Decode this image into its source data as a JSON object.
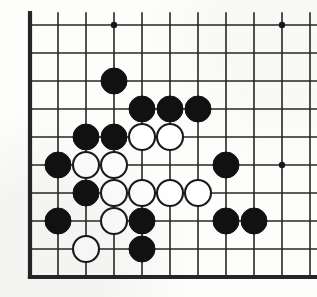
{
  "app": {
    "title": "Go Board Diagram",
    "game": "Go (Weiqi/Baduk)"
  },
  "board": {
    "width_px": 317,
    "height_px": 297,
    "origin_x": 30,
    "origin_y": 25,
    "spacing": 28,
    "cols": 10,
    "rows": 9,
    "line_color": "#262626",
    "line_width": 1.6,
    "edge_line_width": 4.2,
    "background_color": "#fdfdfb",
    "star_point_color": "#181818",
    "star_point_radius": 3.2,
    "stone_radius": 13,
    "black_color": "#111111",
    "white_color": "#ffffff",
    "white_outline_color": "#1a1a1a",
    "thick_edges": [
      "left",
      "bottom"
    ],
    "star_points": [
      {
        "col": 4,
        "row": 1
      },
      {
        "col": 10,
        "row": 1
      },
      {
        "col": 10,
        "row": 6
      }
    ],
    "stones": [
      {
        "color": "black",
        "col": 4,
        "row": 3
      },
      {
        "color": "black",
        "col": 5,
        "row": 4
      },
      {
        "color": "black",
        "col": 6,
        "row": 4
      },
      {
        "color": "black",
        "col": 7,
        "row": 4
      },
      {
        "color": "black",
        "col": 3,
        "row": 5
      },
      {
        "color": "black",
        "col": 4,
        "row": 5
      },
      {
        "color": "white",
        "col": 5,
        "row": 5
      },
      {
        "color": "white",
        "col": 6,
        "row": 5
      },
      {
        "color": "black",
        "col": 2,
        "row": 6
      },
      {
        "color": "white",
        "col": 3,
        "row": 6
      },
      {
        "color": "white",
        "col": 4,
        "row": 6
      },
      {
        "color": "black",
        "col": 8,
        "row": 6
      },
      {
        "color": "black",
        "col": 3,
        "row": 7
      },
      {
        "color": "white",
        "col": 4,
        "row": 7
      },
      {
        "color": "white",
        "col": 5,
        "row": 7
      },
      {
        "color": "white",
        "col": 6,
        "row": 7
      },
      {
        "color": "white",
        "col": 7,
        "row": 7
      },
      {
        "color": "black",
        "col": 2,
        "row": 8
      },
      {
        "color": "white",
        "col": 4,
        "row": 8
      },
      {
        "color": "black",
        "col": 5,
        "row": 8
      },
      {
        "color": "black",
        "col": 8,
        "row": 8
      },
      {
        "color": "black",
        "col": 9,
        "row": 8
      },
      {
        "color": "white",
        "col": 3,
        "row": 9
      },
      {
        "color": "black",
        "col": 5,
        "row": 9
      }
    ],
    "counts": {
      "black_stones": 14,
      "white_stones": 10,
      "total_stones": 24
    }
  }
}
